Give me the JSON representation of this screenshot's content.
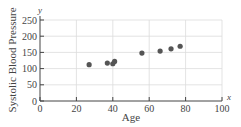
{
  "chart_data": {
    "type": "scatter",
    "title": "",
    "xlabel": "Age",
    "ylabel": "Systolic Blood Pressure",
    "x_axis_var": "x",
    "y_axis_var": "y",
    "xlim": [
      0,
      100
    ],
    "ylim": [
      0,
      250
    ],
    "x_ticks": [
      0,
      20,
      40,
      60,
      80,
      100
    ],
    "y_ticks": [
      0,
      50,
      100,
      150,
      200,
      250
    ],
    "grid": true,
    "legend": null,
    "points": [
      {
        "x": 27,
        "y": 112
      },
      {
        "x": 37,
        "y": 117
      },
      {
        "x": 40,
        "y": 115
      },
      {
        "x": 41,
        "y": 122
      },
      {
        "x": 56,
        "y": 148
      },
      {
        "x": 66,
        "y": 154
      },
      {
        "x": 72,
        "y": 161
      },
      {
        "x": 77,
        "y": 169
      }
    ],
    "colors": {
      "point": "#555555",
      "axis": "#444444",
      "grid": "#dcdcdc"
    }
  }
}
